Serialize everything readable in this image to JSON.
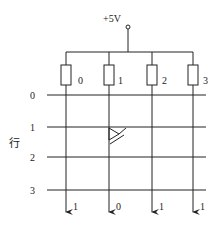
{
  "supply": {
    "label": "+5V"
  },
  "columns": [
    {
      "index": "0",
      "x": 66,
      "output": "1"
    },
    {
      "index": "1",
      "x": 109,
      "output": "0"
    },
    {
      "index": "2",
      "x": 152,
      "output": "1"
    },
    {
      "index": "3",
      "x": 193,
      "output": "1"
    }
  ],
  "rows": [
    {
      "index": "0",
      "y": 95
    },
    {
      "index": "1",
      "y": 127
    },
    {
      "index": "2",
      "y": 157
    },
    {
      "index": "3",
      "y": 190
    }
  ],
  "row_axis_label": "行",
  "diode": {
    "row": 1,
    "column": 1
  },
  "colors": {
    "line": "#222222",
    "background": "#ffffff"
  }
}
